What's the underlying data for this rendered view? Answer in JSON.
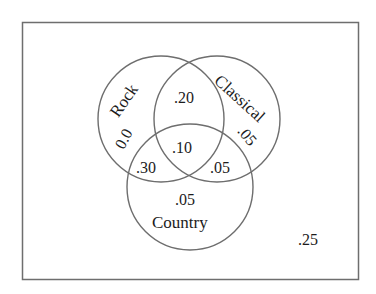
{
  "diagram": {
    "type": "venn",
    "universe_probability": ".25",
    "sets": [
      {
        "name": "Rock"
      },
      {
        "name": "Classical"
      },
      {
        "name": "Country"
      }
    ],
    "regions": {
      "rock_only": "0.0",
      "classical_only": ".05",
      "country_only": ".05",
      "rock_classical_only": ".20",
      "rock_country_only": ".30",
      "classical_country_only": ".05",
      "all_three": ".10",
      "outside": ".25"
    },
    "colors": {
      "stroke": "#6e6e6e",
      "text": "#1c1c1c",
      "background": "#ffffff"
    }
  }
}
